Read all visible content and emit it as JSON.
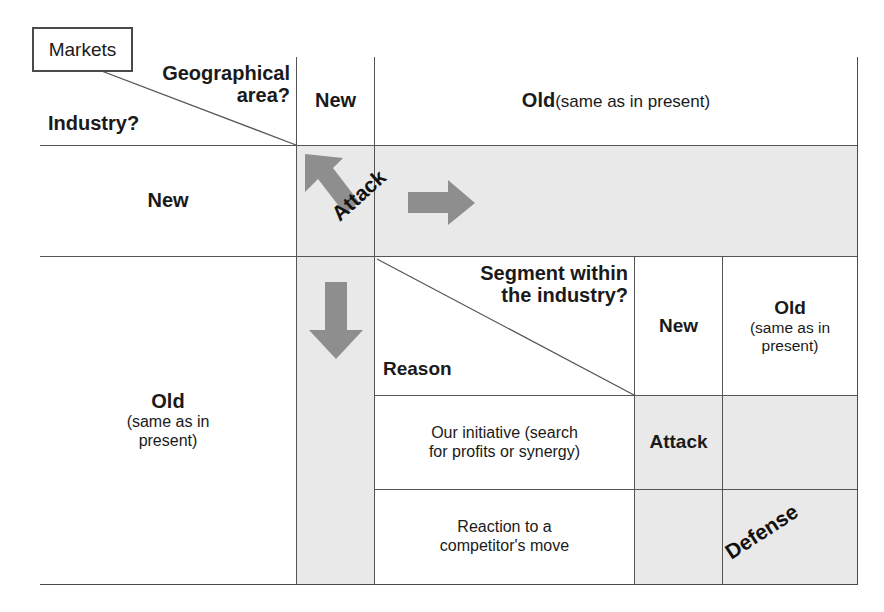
{
  "diagram": {
    "callout": {
      "label": "Markets"
    },
    "header": {
      "top_right_label": "Geographical area?",
      "bottom_left_label": "Industry?",
      "col_new": "New",
      "col_old_bold": "Old",
      "col_old_note": "(same as in present)"
    },
    "rows": {
      "new_label": "New",
      "old_bold": "Old",
      "old_note_line1": "(same as in",
      "old_note_line2": "present)"
    },
    "sub_header": {
      "top_right_label_line1": "Segment within",
      "top_right_label_line2": "the industry?",
      "bottom_left_label": "Reason",
      "col_new": "New",
      "col_old_bold": "Old",
      "col_old_note_line1": "(same as in",
      "col_old_note_line2": "present)"
    },
    "sub_rows": [
      {
        "reason_line1": "Our initiative (search",
        "reason_line2": "for profits or synergy)"
      },
      {
        "reason_line1": "Reaction to a",
        "reason_line2": "competitor's move"
      }
    ],
    "annotations": {
      "attack_diagonal": "Attack",
      "attack_cell": "Attack",
      "defense_diagonal": "Defense"
    },
    "icons": {
      "arrow_up_left": "arrow-up-left-icon",
      "arrow_right": "arrow-right-icon",
      "arrow_down": "arrow-down-icon"
    },
    "colors": {
      "shaded_cell": "#e9e9e9",
      "arrow_gray": "#8e8e8e",
      "border": "#555555",
      "frame": "#4a4a4a",
      "text": "#1a1a1a"
    }
  }
}
